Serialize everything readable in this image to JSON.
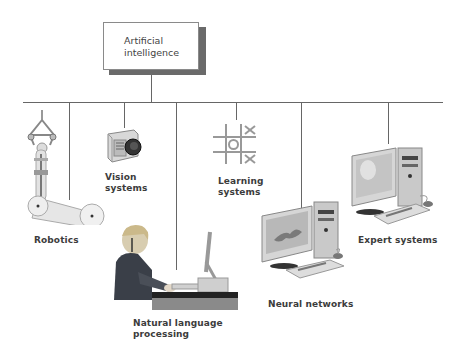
{
  "root": {
    "line1": "Artificial",
    "line2": "intelligence"
  },
  "branches": [
    {
      "id": "robotics",
      "label": "Robotics",
      "icon": "robot-arm-icon"
    },
    {
      "id": "vision",
      "line1": "Vision",
      "line2": "systems",
      "icon": "camera-icon"
    },
    {
      "id": "nlp",
      "line1": "Natural language",
      "line2": "processing",
      "icon": "person-at-computer-icon"
    },
    {
      "id": "learning",
      "line1": "Learning",
      "line2": "systems",
      "icon": "tic-tac-toe-icon"
    },
    {
      "id": "neural",
      "label": "Neural networks",
      "icon": "desktop-computer-icon"
    },
    {
      "id": "expert",
      "label": "Expert systems",
      "icon": "desktop-computer-icon"
    }
  ],
  "colors": {
    "line": "#666666",
    "shadow": "#6a6a6a",
    "text": "#3c3c3c"
  }
}
